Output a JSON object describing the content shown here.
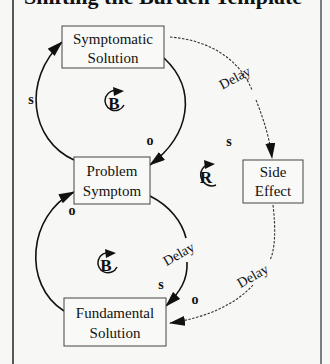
{
  "title": "Shifting the Burden Template",
  "nodes": {
    "symptomatic_solution": {
      "line1": "Symptomatic",
      "line2": "Solution"
    },
    "problem_symptom": {
      "line1": "Problem",
      "line2": "Symptom"
    },
    "side_effect": {
      "line1": "Side",
      "line2": "Effect"
    },
    "fundamental_solution": {
      "line1": "Fundamental",
      "line2": "Solution"
    }
  },
  "loops": {
    "top_balancing": "B",
    "reinforcing": "R",
    "bottom_balancing": "B"
  },
  "links": {
    "problem_to_symptomatic": {
      "polarity": "s"
    },
    "symptomatic_to_problem": {
      "polarity": "o"
    },
    "symptomatic_to_side_effect": {
      "polarity": "s",
      "delay": "Delay"
    },
    "fundamental_to_problem": {
      "polarity": "o"
    },
    "problem_to_fundamental": {
      "polarity": "s",
      "delay": "Delay"
    },
    "side_effect_to_fundamental": {
      "polarity": "o",
      "delay": "Delay"
    }
  },
  "colors": {
    "line": "#111111",
    "dashed": "#333333",
    "background": "#f7f7f5",
    "frame": "#222222"
  }
}
